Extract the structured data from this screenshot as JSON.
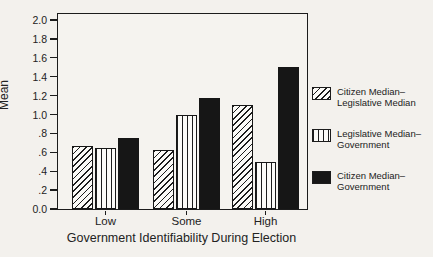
{
  "figure": {
    "background": "#f3f1ed",
    "ink": "#1c1c1c"
  },
  "chart_data": {
    "type": "bar",
    "title": "",
    "xlabel": "Government Identifiability During Election",
    "ylabel": "Mean",
    "categories": [
      "Low",
      "Some",
      "High"
    ],
    "series": [
      {
        "name": "Citizen Median–Legislative Median",
        "pattern": "diagonal-hatch",
        "values": [
          0.67,
          0.62,
          1.1
        ]
      },
      {
        "name": "Legislative Median–Government",
        "pattern": "vertical-lines",
        "values": [
          0.65,
          1.0,
          0.5
        ]
      },
      {
        "name": "Citizen Median–Government",
        "pattern": "solid-black",
        "values": [
          0.75,
          1.18,
          1.5
        ]
      }
    ],
    "ylim": [
      0.0,
      2.0
    ],
    "ytick_step": 0.2,
    "ytick_labels": [
      "0.0",
      ".2",
      ".4",
      ".6",
      ".8",
      "1.0",
      "1.2",
      "1.4",
      "1.6",
      "1.8",
      "2.0"
    ],
    "grid": false,
    "legend_position": "right"
  },
  "legend": {
    "items": [
      {
        "line1": "Citizen Median–",
        "line2": "Legislative Median",
        "swatch": "diagonal-hatch"
      },
      {
        "line1": "Legislative Median–",
        "line2": "Government",
        "swatch": "vertical-lines"
      },
      {
        "line1": "Citizen Median–",
        "line2": "Government",
        "swatch": "solid-black"
      }
    ]
  }
}
